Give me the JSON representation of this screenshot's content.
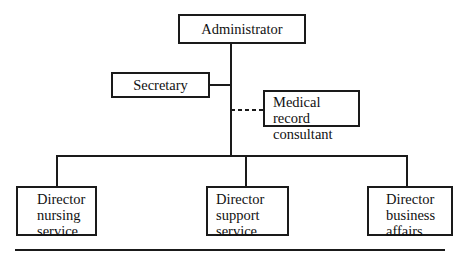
{
  "diagram": {
    "type": "org-chart",
    "nodes": {
      "administrator": {
        "label": "Administrator"
      },
      "secretary": {
        "label": "Secretary"
      },
      "medical_record": {
        "line1": "Medical record",
        "line2": "consultant"
      },
      "nursing": {
        "line1": "Director",
        "line2": "nursing",
        "line3": "service"
      },
      "support": {
        "line1": "Director",
        "line2": "support",
        "line3": "service"
      },
      "business": {
        "line1": "Director",
        "line2": "business",
        "line3": "affairs"
      }
    },
    "edges": [
      {
        "from": "administrator",
        "to": "secretary",
        "style": "solid"
      },
      {
        "from": "administrator",
        "to": "medical_record",
        "style": "dashed"
      },
      {
        "from": "administrator",
        "to": "nursing",
        "style": "solid"
      },
      {
        "from": "administrator",
        "to": "support",
        "style": "solid"
      },
      {
        "from": "administrator",
        "to": "business",
        "style": "solid"
      }
    ],
    "colors": {
      "line": "#1a1a1a",
      "background": "#ffffff"
    }
  }
}
